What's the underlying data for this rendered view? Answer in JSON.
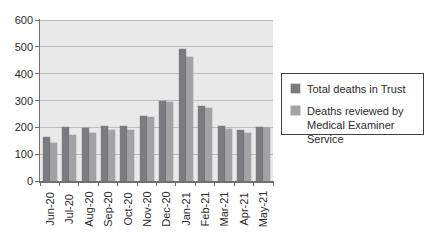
{
  "chart_data": {
    "type": "bar",
    "title": "",
    "xlabel": "",
    "ylabel": "",
    "categories": [
      "Jun-20",
      "Jul-20",
      "Aug-20",
      "Sep-20",
      "Oct-20",
      "Nov-20",
      "Dec-20",
      "Jan-21",
      "Feb-21",
      "Mar-21",
      "Apr-21",
      "May-21"
    ],
    "series": [
      {
        "name": "Total deaths in Trust",
        "color": "#7c7c80",
        "values": [
          165,
          200,
          197,
          204,
          207,
          241,
          297,
          492,
          279,
          204,
          191,
          200
        ]
      },
      {
        "name": "Deaths reviewed by Medical Examiner Service",
        "color": "#a2a2a4",
        "values": [
          142,
          170,
          180,
          190,
          189,
          238,
          295,
          464,
          272,
          194,
          180,
          196
        ]
      }
    ],
    "ylim": [
      0,
      600
    ],
    "ytick_interval": 100,
    "grid": "horizontal",
    "legend_position": "right",
    "legend_entries": [
      {
        "lines": [
          "Total deaths in Trust"
        ]
      },
      {
        "lines": [
          "Deaths reviewed by",
          "Medical Examiner Service"
        ]
      }
    ]
  },
  "style": {
    "background": "#ffffff",
    "plot_background": "#e9e9e9",
    "gridline_color": "#bcbcbc",
    "axis_color": "#707070",
    "text_color": "#2a2a2a",
    "legend_border_color": "#3f3f3f",
    "legend_background": "#ffffff"
  }
}
